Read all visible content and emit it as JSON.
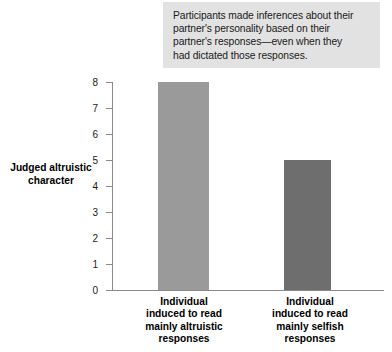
{
  "figure": {
    "background_color": "#ffffff"
  },
  "caption": {
    "background_color": "#e2e2e2",
    "lines": [
      "Participants made inferences about their",
      "partner's personality based on their",
      "partner's responses—even when they",
      "had dictated those responses."
    ],
    "text": "Participants made inferences about their partner's personality based on their partner's responses—even when they had dictated those responses."
  },
  "chart_data": {
    "type": "bar",
    "title": "",
    "subtitle": "",
    "xlabel": "",
    "ylabel": "Judged altruistic character",
    "ylabel_lines": [
      "Judged altruistic",
      "character"
    ],
    "categories": [
      "Individual induced to read mainly altruistic responses",
      "Individual induced to read mainly selfish responses"
    ],
    "category_lines": [
      [
        "Individual",
        "induced to read",
        "mainly altruistic",
        "responses"
      ],
      [
        "Individual",
        "induced to read",
        "mainly selfish",
        "responses"
      ]
    ],
    "values": [
      8,
      5
    ],
    "bar_colors": [
      "#9a9a9a",
      "#6e6e6e"
    ],
    "ylim": [
      0,
      8
    ],
    "yticks": [
      0,
      1,
      2,
      3,
      4,
      5,
      6,
      7,
      8
    ],
    "ytick_labels": [
      "0",
      "1",
      "2",
      "3",
      "4",
      "5",
      "6",
      "7",
      "8"
    ],
    "grid": false,
    "legend": null,
    "axis_color": "#8a8a8a"
  }
}
